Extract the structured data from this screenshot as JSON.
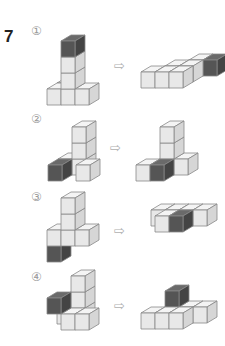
{
  "question_number": "7",
  "arrow_glyph": "⇨",
  "colors": {
    "light_front": "#e8e8e8",
    "light_top": "#f4f4f4",
    "light_side": "#d6d6d6",
    "dark_front": "#555555",
    "dark_top": "#6a6a6a",
    "dark_side": "#444444",
    "edge": "#888888"
  },
  "cube": {
    "w": 14,
    "h": 16,
    "dx": 10,
    "dy": -6
  },
  "items": [
    {
      "label": "①",
      "label_pos": [
        31,
        24
      ],
      "arrow_pos": [
        114,
        58
      ],
      "left": {
        "origin": [
          47,
          105
        ],
        "cubes": [
          [
            0,
            0,
            1,
            0
          ],
          [
            0,
            0,
            0,
            0
          ],
          [
            1,
            0,
            0,
            0
          ],
          [
            2,
            0,
            0,
            0
          ],
          [
            1,
            1,
            0,
            0
          ],
          [
            1,
            2,
            0,
            0
          ],
          [
            1,
            3,
            0,
            1
          ]
        ]
      },
      "right": {
        "origin": [
          141,
          88
        ],
        "cubes": [
          [
            3,
            0,
            2,
            1
          ],
          [
            2,
            0,
            2,
            0
          ],
          [
            1,
            0,
            1,
            0
          ],
          [
            2,
            0,
            1,
            0
          ],
          [
            0,
            0,
            0,
            0
          ],
          [
            1,
            0,
            0,
            0
          ],
          [
            2,
            0,
            0,
            0
          ]
        ]
      }
    },
    {
      "label": "②",
      "label_pos": [
        31,
        112
      ],
      "arrow_pos": [
        110,
        140
      ],
      "left": {
        "origin": [
          48,
          181
        ],
        "cubes": [
          [
            0,
            0,
            1,
            0
          ],
          [
            1,
            0,
            1,
            0
          ],
          [
            1,
            1,
            1,
            0
          ],
          [
            1,
            2,
            1,
            0
          ],
          [
            0,
            0,
            0,
            1
          ],
          [
            2,
            0,
            0,
            0
          ]
        ]
      },
      "right": {
        "origin": [
          136,
          181
        ],
        "cubes": [
          [
            2,
            0,
            1,
            0
          ],
          [
            1,
            0,
            1,
            0
          ],
          [
            1,
            1,
            1,
            0
          ],
          [
            1,
            2,
            1,
            0
          ],
          [
            0,
            0,
            0,
            0
          ],
          [
            1,
            0,
            0,
            1
          ]
        ]
      }
    },
    {
      "label": "③",
      "label_pos": [
        31,
        190
      ],
      "arrow_pos": [
        114,
        223
      ],
      "left": {
        "origin": [
          47,
          262
        ],
        "cubes": [
          [
            0,
            0,
            0,
            1
          ],
          [
            0,
            1,
            0,
            0
          ],
          [
            1,
            1,
            0,
            0
          ],
          [
            1,
            2,
            0,
            0
          ],
          [
            1,
            3,
            0,
            0
          ],
          [
            2,
            1,
            0,
            0
          ]
        ]
      },
      "right": {
        "origin": [
          141,
          232
        ],
        "cubes": [
          [
            0,
            0,
            1,
            0
          ],
          [
            1,
            0,
            1,
            0
          ],
          [
            2,
            0,
            1,
            0
          ],
          [
            3,
            0,
            1,
            0
          ],
          [
            1,
            0,
            0,
            0
          ],
          [
            2,
            0,
            0,
            1
          ]
        ]
      }
    },
    {
      "label": "④",
      "label_pos": [
        31,
        270
      ],
      "arrow_pos": [
        114,
        298
      ],
      "left": {
        "origin": [
          47,
          330
        ],
        "cubes": [
          [
            0,
            0,
            1,
            0
          ],
          [
            1,
            0,
            1,
            0
          ],
          [
            1,
            1,
            1,
            0
          ],
          [
            1,
            2,
            1,
            0
          ],
          [
            0,
            1,
            0,
            1
          ],
          [
            2,
            0,
            0,
            0
          ],
          [
            1,
            0,
            0,
            0
          ]
        ]
      },
      "right": {
        "origin": [
          141,
          329
        ],
        "cubes": [
          [
            3,
            0,
            1,
            0
          ],
          [
            2,
            0,
            1,
            0
          ],
          [
            1,
            0,
            1,
            0
          ],
          [
            1,
            1,
            1,
            1
          ],
          [
            0,
            0,
            0,
            0
          ],
          [
            1,
            0,
            0,
            0
          ],
          [
            2,
            0,
            0,
            0
          ]
        ]
      }
    }
  ]
}
